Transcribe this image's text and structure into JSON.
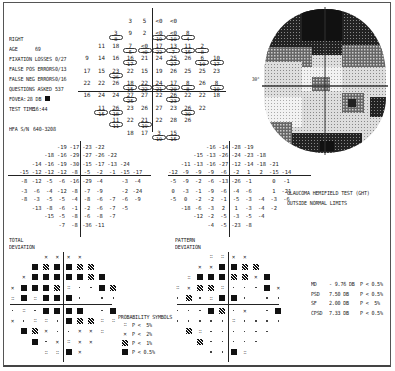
{
  "patient_info": {
    "eye": "RIGHT",
    "age_label": "AGE",
    "age": "69",
    "fixation_losses_label": "FIXATION LOSSES",
    "fixation_losses": "0/27",
    "false_pos_label": "FALSE POS ERRORS",
    "false_pos": "0/13",
    "false_neg_label": "FALSE NEG ERRORS",
    "false_neg": "0/16",
    "questions_label": "QUESTIONS ASKED",
    "questions": "537",
    "fovea_label": "FOVEA:",
    "fovea": "28 DB",
    "test_time_label": "TEST TIME",
    "test_time": "16:44",
    "serial_label": "HFA S/N",
    "serial": "640-3208"
  },
  "threshold_grid": {
    "rows": [
      [
        {
          "v": "3"
        },
        {
          "v": "5"
        },
        {
          "v": "<0",
          "p": ""
        },
        {
          "v": "<0"
        }
      ],
      [
        {
          "v": "3",
          "p": "8"
        },
        {
          "v": "9"
        },
        {
          "v": "2"
        },
        {
          "v": "<0",
          "p": "10"
        },
        {
          "v": "<0",
          "p": "10"
        },
        {
          "v": "8",
          "p": "4"
        }
      ],
      [
        {
          "v": "11"
        },
        {
          "v": "18"
        },
        {
          "v": "7",
          "p": "5"
        },
        {
          "v": "<0",
          "p": "<0"
        },
        {
          "v": "17",
          "p": "22"
        },
        {
          "v": "13",
          "p": "7"
        },
        {
          "v": "11",
          "p": "15"
        },
        {
          "v": "2",
          "p": "8"
        }
      ],
      [
        {
          "v": "9"
        },
        {
          "v": "14"
        },
        {
          "v": "16"
        },
        {
          "v": "16",
          "p": "17"
        },
        {
          "v": "21"
        },
        {
          "v": "24"
        },
        {
          "v": "25",
          "p": "27"
        },
        {
          "v": "26"
        },
        {
          "v": "6",
          "p": "10"
        },
        {
          "v": "10",
          "p": "17"
        }
      ],
      [
        {
          "v": "17"
        },
        {
          "v": "15"
        },
        {
          "v": "23",
          "p": "26"
        },
        {
          "v": "22"
        },
        {
          "v": "15"
        },
        {
          "v": "19"
        },
        {
          "v": "26"
        },
        {
          "v": "25"
        },
        {
          "v": "25"
        },
        {
          "v": "23"
        }
      ],
      [
        {
          "v": "22"
        },
        {
          "v": "22"
        },
        {
          "v": "26"
        },
        {
          "v": "18",
          "p": "15"
        },
        {
          "v": "22",
          "p": "22"
        },
        {
          "v": "24",
          "p": "21"
        },
        {
          "v": "17",
          "p": "20"
        },
        {
          "v": "8",
          "p": "8"
        },
        {
          "v": "26"
        },
        {
          "v": "8",
          "p": "10"
        }
      ],
      [
        {
          "v": "16"
        },
        {
          "v": "24"
        },
        {
          "v": "24"
        },
        {
          "v": "27",
          "p": "25"
        },
        {
          "v": "27"
        },
        {
          "v": "22"
        },
        {
          "v": "26",
          "p": "23"
        },
        {
          "v": "22"
        },
        {
          "v": "22"
        },
        {
          "v": "18"
        }
      ],
      [
        {
          "v": "11",
          "p": "15"
        },
        {
          "v": "26",
          "p": "18"
        },
        {
          "v": "23"
        },
        {
          "v": "26"
        },
        {
          "v": "27"
        },
        {
          "v": "23"
        },
        {
          "v": "26",
          "p": "30"
        },
        {
          "v": "22"
        }
      ],
      [
        {
          "v": "11",
          "p": "11"
        },
        {
          "v": "22"
        },
        {
          "v": "21",
          "p": "19"
        },
        {
          "v": "22"
        },
        {
          "v": "28"
        },
        {
          "v": "26"
        }
      ],
      [
        {
          "v": "18"
        },
        {
          "v": "17"
        },
        {
          "v": "3",
          "p": "10"
        },
        {
          "v": "15",
          "p": "15"
        }
      ]
    ]
  },
  "grayscale_plot": {
    "left_label": "30°",
    "right_label": "30°"
  },
  "total_deviation": {
    "title_line1": "TOTAL",
    "title_line2": "DEVIATION",
    "rows": [
      [
        "-19",
        "-17",
        "-23",
        "-22"
      ],
      [
        "-18",
        "-16",
        "-29",
        "-27",
        "-26",
        "-22"
      ],
      [
        "-14",
        "-16",
        "-19",
        "-30",
        "-15",
        "-17",
        "-13",
        "-24"
      ],
      [
        "-15",
        "-12",
        "-12",
        "-12",
        "-8",
        "-5",
        "-2",
        "-1",
        "-15",
        "-17"
      ],
      [
        "-8",
        "-12",
        "-5",
        "-6",
        "-16",
        "-29",
        "-4",
        "",
        "-3",
        "-4"
      ],
      [
        "-3",
        "-6",
        "-4",
        "-12",
        "-8",
        "-7",
        "-9",
        "",
        "-2",
        "-24"
      ],
      [
        "-8",
        "-3",
        "-5",
        "-5",
        "-4",
        "-8",
        "-6",
        "-7",
        "-6",
        "-9"
      ],
      [
        "-13",
        "-8",
        "-6",
        "-1",
        "-2",
        "-6",
        "-7",
        "-5"
      ],
      [
        "-15",
        "-5",
        "-8",
        "-6",
        "-8",
        "-7"
      ],
      [
        "-7",
        "-8",
        "-36",
        "-11"
      ]
    ]
  },
  "pattern_deviation": {
    "title_line1": "PATTERN",
    "title_line2": "DEVIATION",
    "rows": [
      [
        "-16",
        "-14",
        "-28",
        "-19"
      ],
      [
        "-15",
        "-13",
        "-26",
        "-24",
        "-23",
        "-18"
      ],
      [
        "-11",
        "-13",
        "-16",
        "-27",
        "-12",
        "-14",
        "-18",
        "-21"
      ],
      [
        "-12",
        "-9",
        "-9",
        "-9",
        "-6",
        "-2",
        "1",
        "2",
        "-15",
        "-14"
      ],
      [
        "-5",
        "-9",
        "-2",
        "-6",
        "-13",
        "-26",
        "-1",
        "",
        "0",
        "-1"
      ],
      [
        "0",
        "-3",
        "-1",
        "-9",
        "-6",
        "-4",
        "-6",
        "",
        "1",
        "-21"
      ],
      [
        "-5",
        "0",
        "-2",
        "-2",
        "-1",
        "-5",
        "-3",
        "-4",
        "-3",
        "-6"
      ],
      [
        "-18",
        "-6",
        "-3",
        "2",
        "1",
        "-3",
        "-4",
        "-2"
      ],
      [
        "-12",
        "-2",
        "-5",
        "-3",
        "-5",
        "-4"
      ],
      [
        "-4",
        "-5",
        "-23",
        "-8"
      ]
    ]
  },
  "total_dev_probability": {
    "rows": [
      [
        "z",
        "z",
        "z",
        "z"
      ],
      [
        "b",
        "h",
        "b",
        "b",
        "h",
        "h"
      ],
      [
        "z",
        "b",
        "b",
        "b",
        "b",
        "b",
        "h",
        "b"
      ],
      [
        "z",
        "b",
        "b",
        "b",
        "h",
        "d",
        "s",
        "s",
        "b",
        "h"
      ],
      [
        "d",
        "b",
        "d",
        "b",
        "b",
        "b",
        "s",
        "",
        "s",
        "s"
      ],
      [
        "s",
        "d",
        "s",
        "b",
        "b",
        "b",
        "b",
        "",
        "s",
        "b"
      ],
      [
        "z",
        "s",
        "d",
        "d",
        "s",
        "b",
        "h",
        "h",
        "d",
        "d"
      ],
      [
        "b",
        "h",
        "z",
        "s",
        "s",
        "z",
        "z",
        "d"
      ],
      [
        "b",
        "s",
        "z",
        "d",
        "z",
        "z"
      ],
      [
        "d",
        "d",
        "b",
        "z"
      ]
    ]
  },
  "pattern_dev_probability": {
    "rows": [
      [
        "d",
        "d",
        "z",
        "z"
      ],
      [
        "z",
        "z",
        "b",
        "b",
        "h",
        "h"
      ],
      [
        "d",
        "b",
        "b",
        "b",
        "h",
        "h",
        "z",
        "b"
      ],
      [
        "d",
        "z",
        "h",
        "h",
        "d",
        "s",
        "s",
        "s",
        "b",
        "z"
      ],
      [
        "s",
        "h",
        "s",
        "d",
        "b",
        "b",
        "s",
        "",
        "s",
        "s"
      ],
      [
        "s",
        "s",
        "s",
        "b",
        "h",
        "s",
        "z",
        "",
        "s",
        "b"
      ],
      [
        "s",
        "s",
        "s",
        "s",
        "s",
        "d",
        "s",
        "s",
        "s",
        "s"
      ],
      [
        "h",
        "d",
        "s",
        "s",
        "s",
        "s",
        "s",
        "s"
      ],
      [
        "h",
        "s",
        "s",
        "s",
        "s",
        "s"
      ],
      [
        "s",
        "s",
        "b",
        "d"
      ]
    ]
  },
  "ght": {
    "line1": "GLAUCOMA HEMIFIELD TEST (GHT)",
    "line2": "OUTSIDE NORMAL LIMITS"
  },
  "legend": {
    "title": "PROBABILITY SYMBOLS",
    "items": [
      {
        "sym": "d",
        "text": "P <  5%"
      },
      {
        "sym": "z",
        "text": "P <  2%"
      },
      {
        "sym": "h",
        "text": "P <  1%"
      },
      {
        "sym": "b",
        "text": "P < 0.5%"
      }
    ]
  },
  "global_indices": [
    {
      "label": "MD",
      "value": "- 9.76 DB",
      "p": "P < 0.5%"
    },
    {
      "label": "PSD",
      "value": "7.50 DB",
      "p": "P < 0.5%"
    },
    {
      "label": "SF",
      "value": "2.00 DB",
      "p": "P <  5%"
    },
    {
      "label": "CPSD",
      "value": "7.33 DB",
      "p": "P < 0.5%"
    }
  ]
}
